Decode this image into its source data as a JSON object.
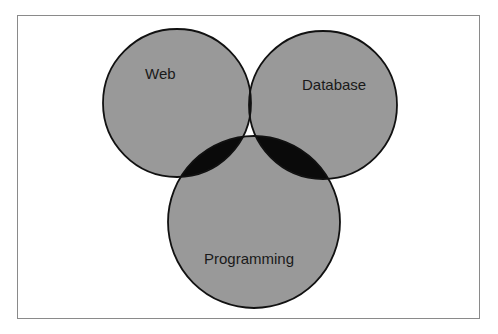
{
  "diagram": {
    "type": "venn",
    "sets": [
      {
        "id": "web",
        "label": "Web",
        "cx": 177,
        "cy": 103,
        "r": 74
      },
      {
        "id": "database",
        "label": "Database",
        "cx": 323,
        "cy": 105,
        "r": 74
      },
      {
        "id": "programming",
        "label": "Programming",
        "cx": 254,
        "cy": 222,
        "r": 86
      }
    ],
    "colors": {
      "set_fill": "#999999",
      "pairwise_overlap_fill": "#0a0a0a",
      "triple_overlap_fill": "#999999",
      "outline": "#111111",
      "frame_border": "#8a8a8a",
      "background": "#ffffff"
    }
  }
}
